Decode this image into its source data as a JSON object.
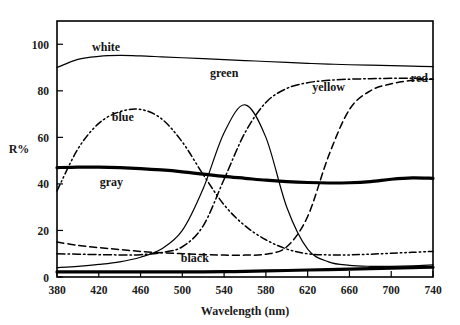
{
  "chart_data": {
    "type": "line",
    "title": "",
    "xlabel": "Wavelength (nm)",
    "ylabel": "R%",
    "xlim": [
      380,
      740
    ],
    "ylim": [
      0,
      110
    ],
    "xticks": [
      380,
      420,
      460,
      500,
      540,
      580,
      620,
      660,
      700,
      740
    ],
    "yticks": [
      0,
      20,
      40,
      60,
      80,
      100
    ],
    "grid": false,
    "legend": "inline-curve-labels",
    "x": [
      380,
      400,
      420,
      440,
      460,
      480,
      500,
      520,
      540,
      560,
      580,
      600,
      620,
      640,
      660,
      680,
      700,
      720,
      740
    ],
    "series": [
      {
        "name": "white",
        "label": "white",
        "style": "solid-thin",
        "values": [
          90,
          93.5,
          94.8,
          95.2,
          95.0,
          94.6,
          94.2,
          93.8,
          93.4,
          93.0,
          92.6,
          92.2,
          91.8,
          91.5,
          91.2,
          91.0,
          90.8,
          90.6,
          90.4
        ]
      },
      {
        "name": "gray",
        "label": "gray",
        "style": "solid-thick",
        "values": [
          47,
          47.2,
          47.2,
          47.0,
          46.6,
          46.0,
          45.2,
          44.2,
          43.2,
          42.4,
          41.6,
          41.0,
          40.6,
          40.4,
          40.5,
          41.0,
          42.0,
          42.6,
          42.4
        ]
      },
      {
        "name": "black",
        "label": "black",
        "style": "solid-thick",
        "values": [
          2.2,
          2.2,
          2.2,
          2.2,
          2.2,
          2.2,
          2.2,
          2.2,
          2.3,
          2.4,
          2.6,
          2.8,
          3.0,
          3.2,
          3.4,
          3.6,
          3.8,
          4.0,
          4.2
        ]
      },
      {
        "name": "blue",
        "label": "blue",
        "style": "dash-dot-dot",
        "values": [
          37,
          55,
          66,
          71,
          72,
          68,
          58,
          44,
          31,
          22,
          16,
          12,
          10,
          9.5,
          9.5,
          9.8,
          10.2,
          10.6,
          11.0
        ]
      },
      {
        "name": "green",
        "label": "green",
        "style": "solid-thin",
        "values": [
          4,
          4.6,
          5.4,
          6.5,
          8.5,
          12,
          20,
          38,
          62,
          74,
          60,
          30,
          12,
          6.5,
          5.0,
          4.6,
          4.6,
          4.8,
          5.2
        ]
      },
      {
        "name": "yellow",
        "label": "yellow",
        "style": "dash-dot",
        "values": [
          10,
          9.8,
          9.6,
          9.5,
          9.6,
          10.5,
          13,
          22,
          42,
          62,
          75,
          81,
          83.5,
          84.5,
          85,
          85.2,
          85.4,
          85.4,
          85.0
        ]
      },
      {
        "name": "red",
        "label": "red",
        "style": "dashed",
        "values": [
          15,
          13.6,
          12.6,
          11.8,
          11.0,
          10.4,
          10.0,
          9.6,
          9.4,
          9.4,
          9.8,
          13,
          26,
          52,
          72,
          80,
          83,
          84.5,
          85.0
        ]
      }
    ],
    "curve_labels": [
      {
        "text": "white",
        "x": 427,
        "y": 97
      },
      {
        "text": "blue",
        "x": 443,
        "y": 67
      },
      {
        "text": "green",
        "x": 540,
        "y": 86
      },
      {
        "text": "yellow",
        "x": 640,
        "y": 80
      },
      {
        "text": "red",
        "x": 727,
        "y": 84
      },
      {
        "text": "gray",
        "x": 432,
        "y": 39
      },
      {
        "text": "black",
        "x": 512,
        "y": 6.5
      }
    ]
  }
}
